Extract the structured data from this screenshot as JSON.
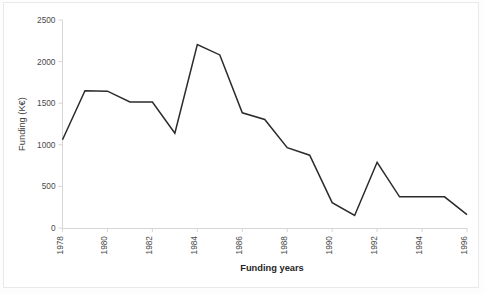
{
  "chart_data": {
    "type": "line",
    "title": "",
    "xlabel": "Funding years",
    "ylabel": "Funding (K€)",
    "xlim": [
      1978,
      1996
    ],
    "ylim": [
      0,
      2500
    ],
    "grid": false,
    "legend": false,
    "legend_position": "none",
    "y_ticks": [
      0,
      500,
      1000,
      1500,
      2000,
      2500
    ],
    "y_tick_labels": [
      "0",
      "500",
      "1000",
      "1500",
      "2000",
      "2500"
    ],
    "x_ticks": [
      1978,
      1980,
      1982,
      1984,
      1986,
      1988,
      1990,
      1992,
      1994,
      1996
    ],
    "x_tick_labels": [
      "1978",
      "1980",
      "1982",
      "1984",
      "1986",
      "1988",
      "1990",
      "1992",
      "1994",
      "1996"
    ],
    "x_tick_rotation": -90,
    "line_color": "#2b2b2b",
    "x": [
      1978,
      1979,
      1980,
      1981,
      1982,
      1983,
      1984,
      1985,
      1986,
      1987,
      1988,
      1989,
      1990,
      1991,
      1992,
      1993,
      1994,
      1995,
      1996
    ],
    "values": [
      1060,
      1650,
      1645,
      1515,
      1515,
      1140,
      2205,
      2080,
      1385,
      1305,
      965,
      875,
      305,
      150,
      790,
      375,
      375,
      375,
      160
    ],
    "series": [
      {
        "name": "Funding",
        "color": "#2b2b2b",
        "values": [
          1060,
          1650,
          1645,
          1515,
          1515,
          1140,
          2205,
          2080,
          1385,
          1305,
          965,
          875,
          305,
          150,
          790,
          375,
          375,
          375,
          160
        ]
      }
    ]
  },
  "axes": {
    "x_title": "Funding years",
    "y_title": "Funding (K€)"
  }
}
